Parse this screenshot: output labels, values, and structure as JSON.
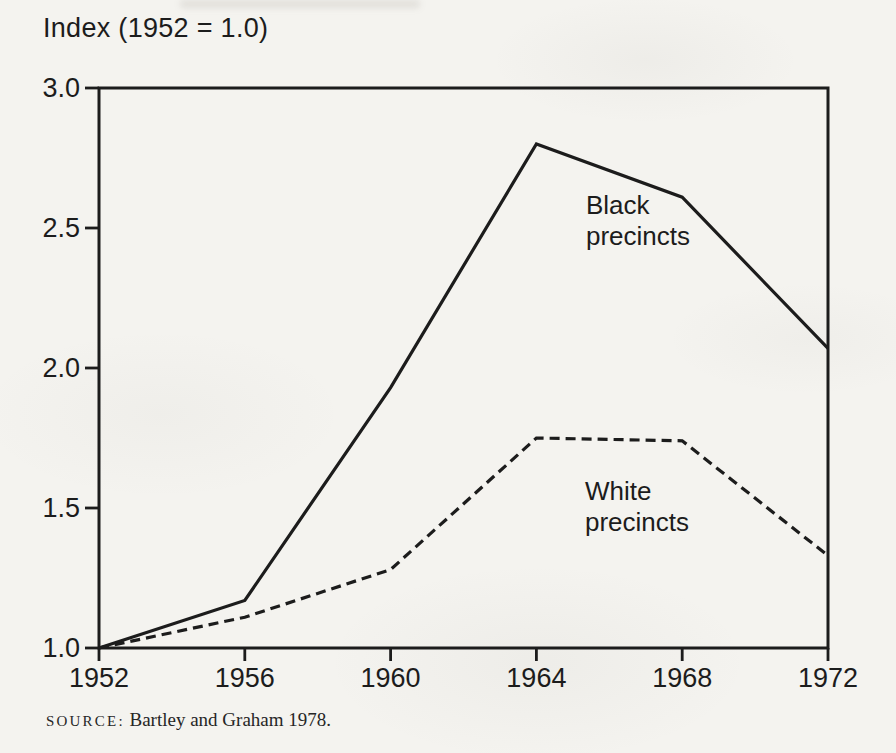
{
  "page": {
    "background_color": "#f4f3ef",
    "ink_color": "#1c1c1c"
  },
  "chart_data": {
    "type": "line",
    "title": "Index (1952 = 1.0)",
    "xlabel": "",
    "ylabel": "Index (1952 = 1.0)",
    "x": [
      1952,
      1956,
      1960,
      1964,
      1968,
      1972
    ],
    "xtick_labels": [
      "1952",
      "1956",
      "1960",
      "1964",
      "1968",
      "1972"
    ],
    "xlim": [
      1952,
      1972
    ],
    "yticks": [
      1.0,
      1.5,
      2.0,
      2.5,
      3.0
    ],
    "ytick_labels": [
      "1.0",
      "1.5",
      "2.0",
      "2.5",
      "3.0"
    ],
    "ylim": [
      1.0,
      3.0
    ],
    "grid": false,
    "legend_position": "inline-labels",
    "series": [
      {
        "name": "Black precincts",
        "label_lines": [
          "Black",
          "precincts"
        ],
        "line_style": "solid",
        "color": "#1c1c1c",
        "values": [
          1.0,
          1.17,
          1.93,
          2.8,
          2.61,
          2.07
        ]
      },
      {
        "name": "White precincts",
        "label_lines": [
          "White",
          "precincts"
        ],
        "line_style": "dashed",
        "color": "#1c1c1c",
        "values": [
          1.0,
          1.11,
          1.28,
          1.75,
          1.74,
          1.33
        ]
      }
    ]
  },
  "source": {
    "label": "SOURCE:",
    "text": " Bartley and Graham 1978."
  }
}
